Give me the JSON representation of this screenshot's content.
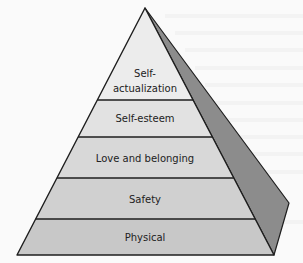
{
  "diagram": {
    "type": "pyramid",
    "title": "",
    "levels": [
      {
        "label_lines": [
          "Self-",
          "actualization"
        ],
        "order_from_top": 1,
        "fill": "#ececec"
      },
      {
        "label_lines": [
          "Self-esteem"
        ],
        "order_from_top": 2,
        "fill": "#e2e2e2"
      },
      {
        "label_lines": [
          "Love and belonging"
        ],
        "order_from_top": 3,
        "fill": "#d8d8d8"
      },
      {
        "label_lines": [
          "Safety"
        ],
        "order_from_top": 4,
        "fill": "#d0d0d0"
      },
      {
        "label_lines": [
          "Physical"
        ],
        "order_from_top": 5,
        "fill": "#c8c8c8"
      }
    ],
    "colors": {
      "side_face": "#8c8c8c",
      "outline": "#1e1e1e",
      "background": "#fafafa"
    }
  }
}
